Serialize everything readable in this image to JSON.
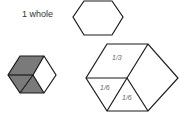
{
  "whole_label": "1 whole",
  "fractions": {
    "third": "1/3",
    "sixth_a": "1/6",
    "sixth_b": "1/6"
  },
  "colors": {
    "shade": "#7a7a7a",
    "stroke": "#1a1a1a"
  }
}
